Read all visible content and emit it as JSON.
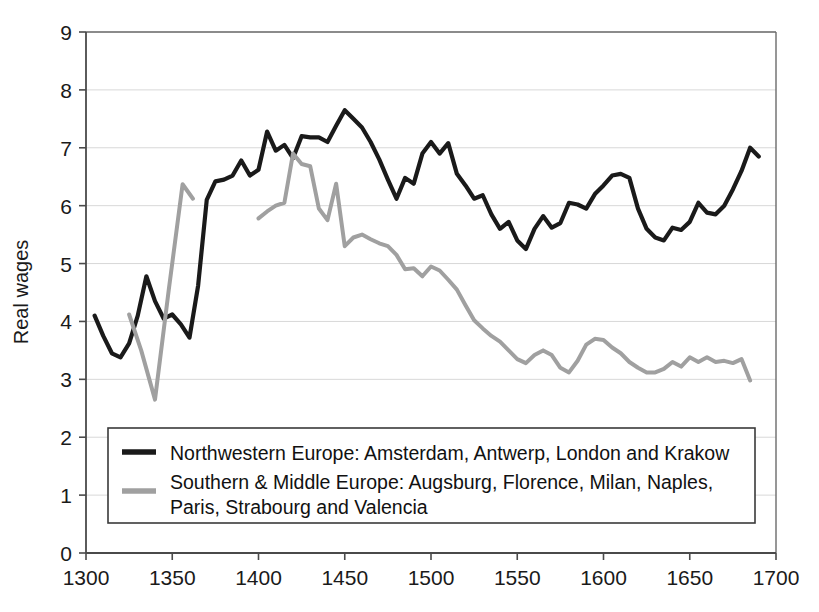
{
  "chart_data": {
    "type": "line",
    "title": "",
    "xlabel": "",
    "ylabel": "Real wages",
    "xlim": [
      1300,
      1700
    ],
    "ylim": [
      0,
      9
    ],
    "xticks": [
      1300,
      1350,
      1400,
      1450,
      1500,
      1550,
      1600,
      1650,
      1700
    ],
    "yticks": [
      0,
      1,
      2,
      3,
      4,
      5,
      6,
      7,
      8,
      9
    ],
    "grid": "horizontal",
    "legend_position": "inside-bottom-left",
    "series": [
      {
        "name": "Northwestern Europe: Amsterdam, Antwerp, London and Krakow",
        "color": "#1a1a1a",
        "x": [
          1305,
          1310,
          1315,
          1320,
          1325,
          1330,
          1335,
          1340,
          1345,
          1350,
          1355,
          1360,
          1365,
          1370,
          1375,
          1380,
          1385,
          1390,
          1395,
          1400,
          1405,
          1410,
          1415,
          1420,
          1425,
          1430,
          1435,
          1440,
          1445,
          1450,
          1455,
          1460,
          1465,
          1470,
          1475,
          1480,
          1485,
          1490,
          1495,
          1500,
          1505,
          1510,
          1515,
          1520,
          1525,
          1530,
          1535,
          1540,
          1545,
          1550,
          1555,
          1560,
          1565,
          1570,
          1575,
          1580,
          1585,
          1590,
          1595,
          1600,
          1605,
          1610,
          1615,
          1620,
          1625,
          1630,
          1635,
          1640,
          1645,
          1650,
          1655,
          1660,
          1665,
          1670,
          1675,
          1680,
          1685,
          1690
        ],
        "values": [
          4.1,
          3.75,
          3.45,
          3.38,
          3.62,
          4.1,
          4.78,
          4.35,
          4.05,
          4.12,
          3.95,
          3.72,
          4.62,
          6.1,
          6.42,
          6.45,
          6.52,
          6.78,
          6.52,
          6.62,
          7.28,
          6.95,
          7.05,
          6.82,
          7.2,
          7.18,
          7.18,
          7.1,
          7.38,
          7.65,
          7.5,
          7.35,
          7.1,
          6.8,
          6.45,
          6.12,
          6.48,
          6.38,
          6.9,
          7.1,
          6.9,
          7.08,
          6.55,
          6.35,
          6.12,
          6.18,
          5.85,
          5.6,
          5.72,
          5.4,
          5.25,
          5.6,
          5.82,
          5.62,
          5.7,
          6.05,
          6.02,
          5.95,
          6.2,
          6.35,
          6.52,
          6.55,
          6.48,
          5.95,
          5.6,
          5.45,
          5.4,
          5.62,
          5.58,
          5.72,
          6.05,
          5.88,
          5.85,
          6.0,
          6.28,
          6.6,
          7.0,
          6.85
        ]
      },
      {
        "name": "Southern & Middle Europe: Augsburg, Florence, Milan, Naples, Paris, Strabourg and Valencia",
        "color": "#a0a0a0",
        "segments": [
          {
            "x": [
              1325,
              1332,
              1340,
              1348,
              1356,
              1362
            ],
            "values": [
              4.12,
              3.5,
              2.65,
              4.55,
              6.37,
              6.12
            ]
          },
          {
            "x": [
              1400,
              1405,
              1410,
              1415,
              1420,
              1425,
              1430,
              1435,
              1440,
              1445,
              1450,
              1455,
              1460,
              1465,
              1470,
              1475,
              1480,
              1485,
              1490,
              1495,
              1500,
              1505,
              1510,
              1515,
              1520,
              1525,
              1530,
              1535,
              1540,
              1545,
              1550,
              1555,
              1560,
              1565,
              1570,
              1575,
              1580,
              1585,
              1590,
              1595,
              1600,
              1605,
              1610,
              1615,
              1620,
              1625,
              1630,
              1635,
              1640,
              1645,
              1650,
              1655,
              1660,
              1665,
              1670,
              1675,
              1680,
              1685,
              1690
            ],
            "values": [
              5.78,
              5.9,
              6.0,
              6.05,
              6.9,
              6.72,
              6.68,
              5.95,
              5.75,
              6.38,
              5.3,
              5.45,
              5.5,
              5.42,
              5.35,
              5.3,
              5.15,
              4.9,
              4.92,
              4.78,
              4.95,
              4.88,
              4.72,
              4.55,
              4.28,
              4.02,
              3.88,
              3.75,
              3.65,
              3.5,
              3.35,
              3.28,
              3.42,
              3.5,
              3.42,
              3.2,
              3.12,
              3.32,
              3.6,
              3.7,
              3.68,
              3.55,
              3.45,
              3.3,
              3.2,
              3.12,
              3.12,
              3.18,
              3.3,
              3.22,
              3.38,
              3.3,
              3.38,
              3.3,
              3.32,
              3.28,
              3.35,
              2.98
            ]
          }
        ]
      }
    ]
  },
  "axis": {
    "y_title": "Real wages",
    "y_tick_labels": [
      "9",
      "8",
      "7",
      "6",
      "5",
      "4",
      "3",
      "2",
      "1",
      "0"
    ],
    "x_tick_labels": [
      "1300",
      "1350",
      "1400",
      "1450",
      "1500",
      "1550",
      "1600",
      "1650",
      "1700"
    ]
  },
  "legend": {
    "entry1_line1": "Northwestern Europe: Amsterdam, Antwerp, London and Krakow",
    "entry2_line1": "Southern & Middle Europe: Augsburg, Florence, Milan, Naples,",
    "entry2_line2": "Paris, Strabourg and Valencia",
    "swatch1_color": "#1a1a1a",
    "swatch2_color": "#a0a0a0"
  },
  "colors": {
    "series1": "#1a1a1a",
    "series2": "#a0a0a0",
    "axis": "#555555",
    "grid": "#d8d8d8",
    "background": "#ffffff"
  }
}
